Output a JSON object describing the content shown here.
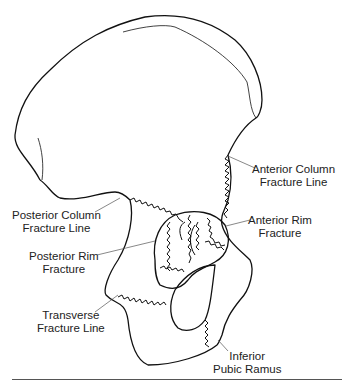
{
  "diagram": {
    "labels": [
      {
        "id": "anterior-column",
        "lines": [
          "Anterior Column",
          "Fracture Line"
        ]
      },
      {
        "id": "posterior-column",
        "lines": [
          "Posterior Column",
          "Fracture Line"
        ]
      },
      {
        "id": "anterior-rim",
        "lines": [
          "Anterior Rim",
          "Fracture"
        ]
      },
      {
        "id": "posterior-rim",
        "lines": [
          "Posterior Rim",
          "Fracture"
        ]
      },
      {
        "id": "transverse",
        "lines": [
          "Transverse",
          "Fracture Line"
        ]
      },
      {
        "id": "inferior-pubic-ramus",
        "lines": [
          "Inferior",
          "Pubic Ramus"
        ]
      }
    ],
    "colors": {
      "line": "#111111",
      "leader": "#555555",
      "text": "#222222",
      "background": "#ffffff"
    }
  }
}
